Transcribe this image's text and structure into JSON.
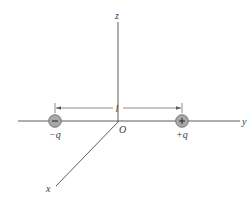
{
  "diagram": {
    "type": "electric-dipole-on-y-axis",
    "axes": {
      "z": {
        "label": "z"
      },
      "y": {
        "label": "y"
      },
      "x": {
        "label": "x"
      },
      "origin": {
        "label": "O"
      }
    },
    "charges": [
      {
        "label": "−q",
        "sign": "−",
        "position": "negative y"
      },
      {
        "label": "+q",
        "sign": "+",
        "position": "positive y"
      }
    ],
    "separation": {
      "label": "l"
    },
    "colors": {
      "axis": "#4a4a4a",
      "charge_fill": "#a8a8a8",
      "charge_stroke": "#6e6e6e",
      "text": "#3a3a3a"
    }
  }
}
